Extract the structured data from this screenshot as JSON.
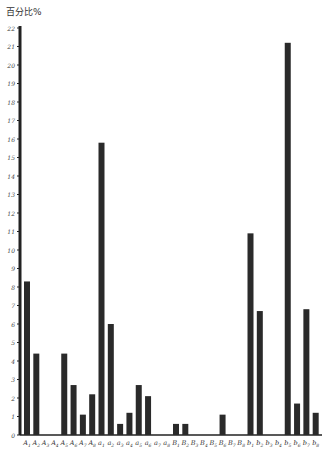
{
  "chart_data": {
    "type": "bar",
    "title": "",
    "xlabel": "",
    "ylabel": "百分比%",
    "ylim": [
      0,
      22
    ],
    "yticks": [
      0,
      1,
      2,
      3,
      4,
      5,
      6,
      7,
      8,
      9,
      10,
      11,
      12,
      13,
      14,
      15,
      16,
      17,
      18,
      19,
      20,
      21,
      22
    ],
    "grid": false,
    "legend": null,
    "bar_color": "#2a2a2a",
    "categories": [
      "A1",
      "A2",
      "A3",
      "A4",
      "A5",
      "A6",
      "A7",
      "A8",
      "a1",
      "a2",
      "a3",
      "a4",
      "a5",
      "a6",
      "a7",
      "a8",
      "B1",
      "B2",
      "B3",
      "B4",
      "B5",
      "B6",
      "B7",
      "B8",
      "b1",
      "b2",
      "b3",
      "b4",
      "b5",
      "b6",
      "b7",
      "b8"
    ],
    "values": [
      8.3,
      4.4,
      0,
      0,
      4.4,
      2.7,
      1.1,
      2.2,
      15.8,
      6.0,
      0.6,
      1.2,
      2.7,
      2.1,
      0,
      0,
      0.6,
      0.6,
      0,
      0,
      0,
      1.1,
      0,
      0,
      10.9,
      6.7,
      0,
      0,
      21.2,
      1.7,
      6.8,
      1.2
    ]
  }
}
